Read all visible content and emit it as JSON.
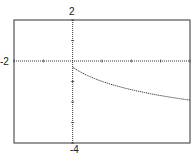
{
  "chart_data": {
    "type": "line",
    "title": "",
    "xlabel": "",
    "ylabel": "",
    "xlim": [
      -2,
      4
    ],
    "ylim": [
      -4,
      2
    ],
    "grid": false,
    "tick_labels": {
      "x_min": "-2",
      "x_max": "4",
      "y_max": "2",
      "y_min": "-4"
    },
    "series": [
      {
        "name": "f(x)",
        "style": "dotted",
        "x": [
          0,
          0.5,
          1,
          1.5,
          2,
          2.5,
          3,
          3.5,
          4
        ],
        "y": [
          -0.3,
          -0.71,
          -0.99,
          -1.22,
          -1.4,
          -1.55,
          -1.69,
          -1.8,
          -1.91
        ]
      }
    ]
  }
}
